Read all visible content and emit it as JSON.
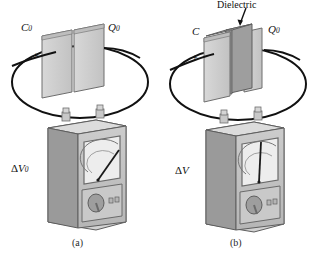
{
  "figure": {
    "background_color": "#ffffff",
    "ink_color": "#111111",
    "plate_fill": "#cdcdcd",
    "plate_edge": "#6e6e6e",
    "dielectric_fill": "#9a9a9a",
    "dielectric_top": "#b4b4b4",
    "meter_front": "#c2c2c2",
    "meter_side": "#8e8e8e",
    "meter_top": "#d6d6d6",
    "gauge_face": "#e8e8e8"
  },
  "panel_a": {
    "caption": "(a)",
    "capacitor_label": "C",
    "capacitor_label_sub": "0",
    "charge_label": "Q",
    "charge_label_sub": "0",
    "positive_sign": "+",
    "negative_sign": "−",
    "meter_label": "ΔV",
    "meter_label_sub": "0",
    "needle_reading_deg": 52,
    "has_dielectric": false
  },
  "panel_b": {
    "caption": "(b)",
    "capacitor_label": "C",
    "capacitor_label_sub": "",
    "charge_label": "Q",
    "charge_label_sub": "0",
    "positive_sign": "+",
    "negative_sign": "−",
    "meter_label": "ΔV",
    "meter_label_sub": "",
    "needle_reading_deg": 0,
    "dielectric_label": "Dielectric",
    "has_dielectric": true
  }
}
